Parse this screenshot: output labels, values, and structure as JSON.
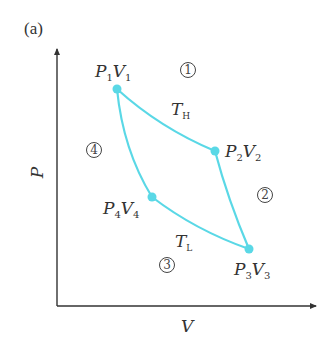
{
  "panel_label": "(a)",
  "axes": {
    "y_label": "P",
    "x_label": "V"
  },
  "points": [
    {
      "id": "1",
      "P": "P",
      "p_sub": "1",
      "V": "V",
      "v_sub": "1"
    },
    {
      "id": "2",
      "P": "P",
      "p_sub": "2",
      "V": "V",
      "v_sub": "2"
    },
    {
      "id": "3",
      "P": "P",
      "p_sub": "3",
      "V": "V",
      "v_sub": "3"
    },
    {
      "id": "4",
      "P": "P",
      "p_sub": "4",
      "V": "V",
      "v_sub": "4"
    }
  ],
  "temperatures": {
    "high": {
      "T": "T",
      "sub": "H"
    },
    "low": {
      "T": "T",
      "sub": "L"
    }
  },
  "process_numbers": [
    "①",
    "②",
    "③",
    "④"
  ],
  "colors": {
    "cycle": "#5ad8e6",
    "axis": "#333333"
  }
}
